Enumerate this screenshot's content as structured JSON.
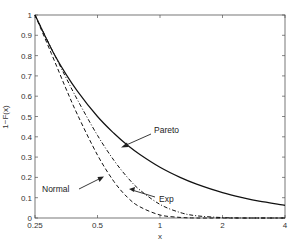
{
  "chart_data": {
    "type": "line",
    "title": "",
    "xlabel": "x",
    "ylabel": "1−F(x)",
    "xscale": "log",
    "xlim": [
      0.25,
      4
    ],
    "ylim": [
      0,
      1
    ],
    "xticks": [
      0.25,
      0.5,
      1,
      2,
      4
    ],
    "xtick_labels": [
      "0.25",
      "0.5",
      "1",
      "2",
      "4"
    ],
    "yticks": [
      0,
      0.1,
      0.2,
      0.3,
      0.4,
      0.5,
      0.6,
      0.7,
      0.8,
      0.9,
      1
    ],
    "ytick_labels": [
      "0",
      "0.1",
      "0.2",
      "0.3",
      "0.4",
      "0.5",
      "0.6",
      "0.7",
      "0.8",
      "0.9",
      "1"
    ],
    "grid": false,
    "legend": "none (arrow annotations)",
    "x": [
      0.25,
      0.3,
      0.35,
      0.4,
      0.5,
      0.6,
      0.7,
      0.8,
      1.0,
      1.25,
      1.5,
      2.0,
      2.5,
      3.0,
      4.0
    ],
    "series": [
      {
        "name": "Pareto",
        "style": "solid",
        "values": [
          1.0,
          0.833,
          0.714,
          0.625,
          0.5,
          0.417,
          0.357,
          0.313,
          0.25,
          0.2,
          0.167,
          0.125,
          0.1,
          0.083,
          0.0625
        ]
      },
      {
        "name": "Exp",
        "style": "dashdot",
        "values": [
          1.0,
          0.835,
          0.698,
          0.583,
          0.407,
          0.284,
          0.198,
          0.138,
          0.067,
          0.027,
          0.011,
          0.002,
          0.0,
          0.0,
          0.0
        ]
      },
      {
        "name": "Normal",
        "style": "dashed",
        "values": [
          1.0,
          0.81,
          0.645,
          0.51,
          0.31,
          0.18,
          0.1,
          0.055,
          0.015,
          0.003,
          0.0,
          0.0,
          0.0,
          0.0,
          0.0
        ]
      }
    ],
    "annotations": [
      {
        "text": "Pareto",
        "target_series": "Pareto"
      },
      {
        "text": "Exp",
        "target_series": "Exp"
      },
      {
        "text": "Normal",
        "target_series": "Normal"
      }
    ]
  },
  "labels": {
    "pareto": "Pareto",
    "exp": "Exp",
    "normal": "Normal",
    "xlabel": "x",
    "ylabel": "1−F(x)"
  }
}
